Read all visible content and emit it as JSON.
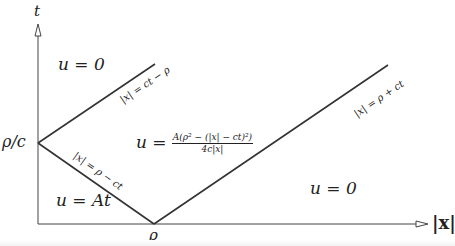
{
  "diagram": {
    "axes": {
      "y_label": "t",
      "x_label": "|x|",
      "y_tick": "ρ/c",
      "x_tick": "ρ"
    },
    "regions": {
      "top_left": "u = 0",
      "bottom_left": "u = At",
      "middle_prefix": "u =",
      "middle_numerator": "A(ρ² − (|x| − ct)²)",
      "middle_denominator": "4c|x|",
      "right": "u = 0"
    },
    "lines": {
      "upper_left": "|x| = ct − ρ",
      "lower_left": "|x| = ρ − ct",
      "right": "|x| = ρ + ct"
    },
    "colors": {
      "line": "#333333",
      "text": "#222222",
      "background": "#ffffff"
    }
  }
}
